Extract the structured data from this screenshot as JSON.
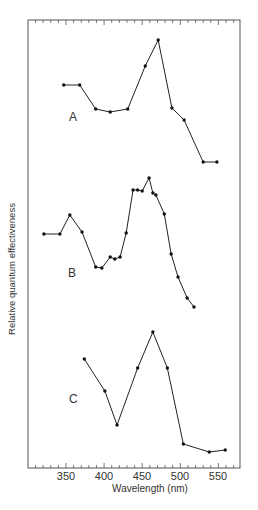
{
  "chart_data": {
    "type": "line",
    "title": "",
    "xlabel": "Wavelength (nm)",
    "ylabel": "Relative quantum effectiveness",
    "xlim": [
      306,
      574
    ],
    "xticks": [
      350,
      400,
      450,
      500,
      550
    ],
    "xtick_labels": [
      "350",
      "400",
      "450",
      "500",
      "550"
    ],
    "grid": false,
    "legend": "none (panels labeled A, B, C inline)",
    "y_units": "arbitrary relative units (no y tick labels shown)",
    "series": [
      {
        "name": "A",
        "x": [
          347,
          368,
          389,
          408,
          431,
          454,
          471,
          489,
          505,
          530,
          548
        ],
        "y": [
          90,
          90,
          66,
          63,
          66,
          109,
          135,
          67,
          55,
          13,
          13
        ]
      },
      {
        "name": "B",
        "x": [
          321,
          342,
          355,
          371,
          389,
          397,
          408,
          414,
          421,
          429,
          438,
          444,
          450,
          459,
          464,
          468,
          479,
          488,
          497,
          509,
          518
        ],
        "y": [
          81,
          81,
          100,
          83,
          48,
          47,
          58,
          56,
          58,
          82,
          125,
          125,
          124,
          137,
          122,
          120,
          101,
          61,
          38,
          17,
          8
        ]
      },
      {
        "name": "C",
        "x": [
          374,
          401,
          417,
          444,
          464,
          483,
          504,
          538,
          559
        ],
        "y": [
          101,
          69,
          35,
          92,
          128,
          92,
          16,
          8,
          10
        ]
      }
    ]
  },
  "labels": {
    "ylabel": "Relative quantum effectiveness",
    "xlabel": "Wavelength (nm)",
    "panel_a": "A",
    "panel_b": "B",
    "panel_c": "C",
    "ticks": [
      "350",
      "400",
      "450",
      "500",
      "550"
    ]
  }
}
